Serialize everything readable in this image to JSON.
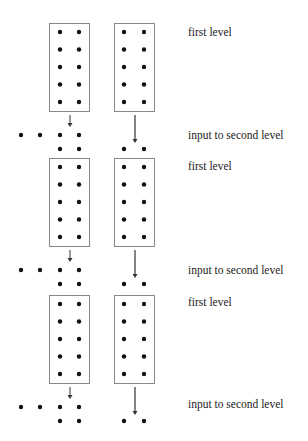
{
  "diagram": {
    "type": "layered-grid-flow",
    "colors": {
      "box_stroke": "#888888",
      "dot": "#111111",
      "arrow": "#333333",
      "text": "#222222"
    },
    "stages": [
      {
        "box_label": "first level",
        "input_label": "input to second level"
      },
      {
        "box_label": "first level",
        "input_label": "input to second level"
      },
      {
        "box_label": "first level",
        "input_label": "input to second level"
      }
    ],
    "box": {
      "columns": 2,
      "rows": 5
    },
    "left_output": {
      "row_a_dots": 4,
      "row_b_dots": 2
    },
    "right_output": {
      "row_b_dots": 2
    }
  }
}
